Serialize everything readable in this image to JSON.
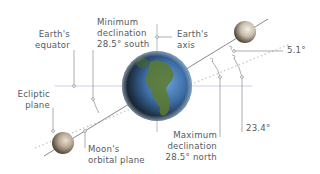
{
  "diagram": {
    "labels": {
      "earths_equator": [
        "Earth's",
        "equator"
      ],
      "minimum_declination": [
        "Minimum",
        "declination",
        "28.5° south"
      ],
      "earths_axis": [
        "Earth's",
        "axis"
      ],
      "ecliptic_plane": [
        "Ecliptic",
        "plane"
      ],
      "moons_orbital_plane": [
        "Moon's",
        "orbital plane"
      ],
      "maximum_declination": [
        "Maximum",
        "declination",
        "28.5° north"
      ],
      "angle_moon_ecliptic": "5.1°",
      "angle_axial_tilt": "23.4°"
    },
    "bodies": [
      {
        "name": "Earth",
        "position": "center"
      },
      {
        "name": "Moon",
        "position": "upper-right (maximum declination)"
      },
      {
        "name": "Moon",
        "position": "lower-left (minimum declination)"
      }
    ],
    "colors": {
      "line": "#8a8a8a",
      "equator": "#b9c6e0",
      "dotted": "#c8c8c8",
      "text": "#555a60",
      "ocean": "#3a6aa8",
      "land": "#5d7a2c",
      "moon": "#a89c8c"
    }
  }
}
